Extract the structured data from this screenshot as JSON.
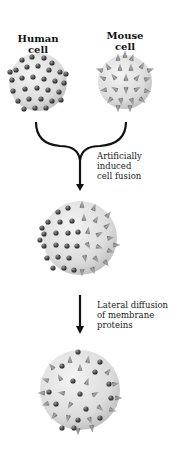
{
  "labels": {
    "human": [
      "Human",
      "cell"
    ],
    "mouse": [
      "Mouse",
      "cell"
    ]
  },
  "steps": [
    {
      "caption": [
        "Artificially",
        "induced",
        "cell fusion"
      ]
    },
    {
      "caption": [
        "Lateral diffusion",
        "of membrane",
        "proteins"
      ]
    }
  ],
  "cells": [
    {
      "name": "human-cell",
      "protein": "sphere",
      "cx": 38,
      "cy": 82,
      "r": 29
    },
    {
      "name": "mouse-cell",
      "protein": "cone",
      "cx": 125,
      "cy": 82,
      "r": 27
    },
    {
      "name": "hybrid-cell-segregated",
      "protein": "mixed-segregated",
      "cx": 80,
      "cy": 238,
      "r": 37
    },
    {
      "name": "hybrid-cell-intermixed",
      "protein": "mixed-intermixed",
      "cx": 80,
      "cy": 390,
      "r": 40
    }
  ],
  "colors": {
    "cell_fill": "#e4e4e4",
    "cell_edge": "#b8b8b8",
    "sphere_protein": "#4a4a4a",
    "cone_protein": "#7a7a7a",
    "arrow": "#111111"
  }
}
